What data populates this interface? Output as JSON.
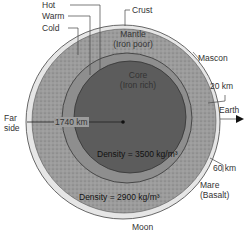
{
  "diagram": {
    "title": "Moon",
    "temperature_labels": [
      "Hot",
      "Warm",
      "Cold"
    ],
    "layers": {
      "crust": "Crust",
      "mantle_line1": "Mantle",
      "mantle_line2": "(Iron poor)",
      "core_line1": "Core",
      "core_line2": "(Iron rich)"
    },
    "annotations": {
      "mascon": "Mascon",
      "thickness_near": "20 km",
      "earth": "Earth",
      "far_side_line1": "Far",
      "far_side_line2": "side",
      "radius": "1740 km",
      "core_density": "Density = 3500 kg/m³",
      "mantle_density": "Density = 2900  kg/m³",
      "thickness_far": "60 km",
      "mare_line1": "Mare",
      "mare_line2": "(Basalt)"
    },
    "colors": {
      "crust": "#e4e4e4",
      "outer_mantle": "#9a9a9a",
      "inner_mantle": "#8a8a8a",
      "core": "#5a5a5a",
      "outline": "#333333"
    }
  }
}
